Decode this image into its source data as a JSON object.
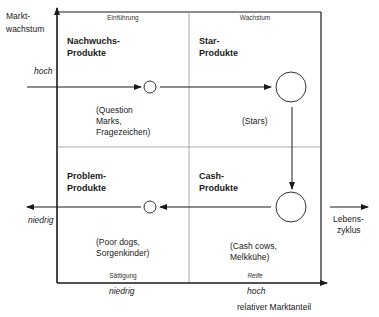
{
  "axes": {
    "y_label_line1": "Markt-",
    "y_label_line2": "wachstum",
    "y_high": "hoch",
    "y_low": "niedrig",
    "x_low": "niedrig",
    "x_high": "hoch",
    "x_label": "relativer Marktanteil",
    "lifecycle_line1": "Lebens-",
    "lifecycle_line2": "zyklus"
  },
  "phases": {
    "top_left": "Einführung",
    "top_right": "Wachstum",
    "bottom_left": "Sättigung",
    "bottom_right": "Reife"
  },
  "quadrants": {
    "top_left": {
      "title_line1": "Nachwuchs-",
      "title_line2": "Produkte",
      "desc_line1": "(Question",
      "desc_line2": "Marks,",
      "desc_line3": "Fragezeichen)"
    },
    "top_right": {
      "title_line1": "Star-",
      "title_line2": "Produkte",
      "desc_line1": "(Stars)"
    },
    "bottom_left": {
      "title_line1": "Problem-",
      "title_line2": "Produkte",
      "desc_line1": "(Poor dogs,",
      "desc_line2": "Sorgenkinder)"
    },
    "bottom_right": {
      "title_line1": "Cash-",
      "title_line2": "Produkte",
      "desc_line1": "(Cash cows,",
      "desc_line2": "Melkkühe)"
    }
  },
  "colors": {
    "line": "#1a1a1a",
    "grid": "#888888",
    "background": "#ffffff"
  }
}
